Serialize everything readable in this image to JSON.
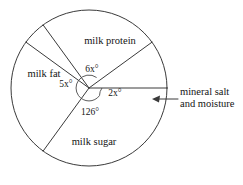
{
  "figure": {
    "background_color": "#ffffff",
    "line_color": "#3a3a3a",
    "text_color": "#141414"
  },
  "circle": {
    "center_x": 89,
    "center_y": 88,
    "radius": 78,
    "inner_arc_radius": 13
  },
  "sectors": [
    {
      "key": "milk_protein",
      "label": "milk protein",
      "angle_label": "6x°",
      "angle_value": 108,
      "label_x": 110,
      "label_y": 42,
      "angle_label_x": 92,
      "angle_label_y": 70
    },
    {
      "key": "milk_fat",
      "label": "milk fat",
      "angle_label": "5x°",
      "angle_value": 90,
      "label_x": 44,
      "label_y": 75,
      "angle_label_x": 66,
      "angle_label_y": 85
    },
    {
      "key": "milk_sugar",
      "label": "milk sugar",
      "angle_label": "126°",
      "angle_value": 126,
      "label_x": 94,
      "label_y": 143,
      "angle_label_x": 90,
      "angle_label_y": 113
    },
    {
      "key": "mineral_salt_and_moisture",
      "label": "mineral salt and moisture",
      "angle_label": "2x°",
      "angle_value": 36,
      "label_x": 0,
      "label_y": 0,
      "angle_label_x": 115,
      "angle_label_y": 94
    }
  ],
  "callout": {
    "line1": "mineral salt",
    "line2": "and moisture",
    "text_x": 180,
    "text_y1": 93,
    "text_y2": 105,
    "leader_x1": 178,
    "leader_y1": 99,
    "leader_x2": 156,
    "leader_y2": 99,
    "arrow_tip_x": 152,
    "arrow_tip_y": 99
  },
  "boundaries_degrees": [
    54,
    144,
    234,
    324,
    360
  ]
}
